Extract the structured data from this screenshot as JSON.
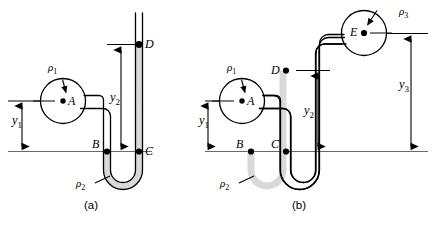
{
  "figure": {
    "background_color": "#ffffff",
    "line_color": "#000000",
    "fluid_fill_color": "#d9d9d9",
    "datum_color": "#555555"
  },
  "panel_a": {
    "caption": "(a)",
    "points": [
      {
        "id": "A",
        "label": "A",
        "dot_side": "left"
      },
      {
        "id": "B",
        "label": "B",
        "dot_side": "right"
      },
      {
        "id": "C",
        "label": "C",
        "dot_side": "left"
      },
      {
        "id": "D",
        "label": "D",
        "dot_side": "left"
      }
    ],
    "densities": [
      {
        "id": "rho1",
        "symbol": "ρ",
        "subscript": "1"
      },
      {
        "id": "rho2",
        "symbol": "ρ",
        "subscript": "2"
      }
    ],
    "dimensions": [
      {
        "id": "y1",
        "symbol": "y",
        "subscript": "1"
      },
      {
        "id": "y2",
        "symbol": "y",
        "subscript": "2"
      }
    ]
  },
  "panel_b": {
    "caption": "(b)",
    "points": [
      {
        "id": "A",
        "label": "A",
        "dot_side": "left"
      },
      {
        "id": "B",
        "label": "B",
        "dot_side": "right"
      },
      {
        "id": "C",
        "label": "C",
        "dot_side": "right"
      },
      {
        "id": "D",
        "label": "D",
        "dot_side": "right"
      },
      {
        "id": "E",
        "label": "E",
        "dot_side": "right"
      }
    ],
    "densities": [
      {
        "id": "rho1",
        "symbol": "ρ",
        "subscript": "1"
      },
      {
        "id": "rho2",
        "symbol": "ρ",
        "subscript": "2"
      },
      {
        "id": "rho3",
        "symbol": "ρ",
        "subscript": "3"
      }
    ],
    "dimensions": [
      {
        "id": "y1",
        "symbol": "y",
        "subscript": "1"
      },
      {
        "id": "y2",
        "symbol": "y",
        "subscript": "2"
      },
      {
        "id": "y3",
        "symbol": "y",
        "subscript": "3"
      }
    ]
  },
  "labels": {
    "a_rho1": "ρ",
    "a_rho1_sub": "1",
    "a_rho2": "ρ",
    "a_rho2_sub": "2",
    "a_y1": "y",
    "a_y1_sub": "1",
    "a_y2": "y",
    "a_y2_sub": "2",
    "a_A": "A",
    "a_B": "B",
    "a_C": "C",
    "a_D": "D",
    "a_caption": "(a)",
    "b_rho1": "ρ",
    "b_rho1_sub": "1",
    "b_rho2": "ρ",
    "b_rho2_sub": "2",
    "b_rho3": "ρ",
    "b_rho3_sub": "3",
    "b_y1": "y",
    "b_y1_sub": "1",
    "b_y2": "y",
    "b_y2_sub": "2",
    "b_y3": "y",
    "b_y3_sub": "3",
    "b_A": "A",
    "b_B": "B",
    "b_C": "C",
    "b_D": "D",
    "b_E": "E",
    "b_caption": "(b)"
  }
}
